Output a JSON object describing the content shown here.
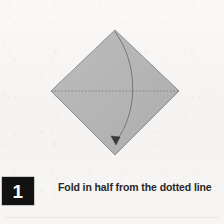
{
  "page": {
    "background_color": "#f6f5f3",
    "width": 224,
    "height": 224
  },
  "figure": {
    "name": "origami-fold-diagram",
    "shape": {
      "name": "paper-diamond",
      "description": "square sheet of paper rotated 45 degrees",
      "fill_color": "#b5b5b5",
      "edge_color": "#8d8d8d",
      "vertices": {
        "top": [
          115,
          30
        ],
        "right": [
          179,
          91
        ],
        "bottom": [
          115,
          155
        ],
        "left": [
          51,
          91
        ]
      }
    },
    "fold_line": {
      "name": "dotted-fold-line",
      "style": "dotted",
      "color": "#7e7e7e",
      "from": [
        51,
        91
      ],
      "to": [
        179,
        91
      ]
    },
    "fold_arrow": {
      "name": "curved-fold-arrow",
      "color": "#6f6f6f",
      "from": [
        115,
        32
      ],
      "control": [
        141,
        92
      ],
      "to": [
        116,
        142
      ],
      "arrowhead_at": [
        116,
        143
      ],
      "arrowhead_direction": "down-left"
    }
  },
  "caption": {
    "step_number": "1",
    "text": "Fold in half from the dotted line",
    "badge_background": "#121212",
    "badge_text_color": "#ffffff",
    "text_color": "#272727"
  }
}
